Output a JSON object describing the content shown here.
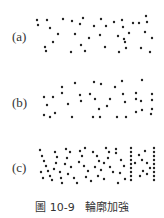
{
  "figure": {
    "caption_number": "圖 10-9",
    "caption_title": "輪廓加強",
    "dot_color": "#222222"
  },
  "panels": [
    {
      "label": "(a)",
      "label_y": 37,
      "dots": [
        [
          37,
          20
        ],
        [
          38,
          25
        ],
        [
          47,
          20
        ],
        [
          50,
          28
        ],
        [
          58,
          34
        ],
        [
          53,
          42
        ],
        [
          45,
          47
        ],
        [
          46,
          51
        ],
        [
          63,
          19
        ],
        [
          72,
          21
        ],
        [
          75,
          34
        ],
        [
          80,
          24
        ],
        [
          83,
          18
        ],
        [
          81,
          45
        ],
        [
          85,
          51
        ],
        [
          89,
          38
        ],
        [
          94,
          26
        ],
        [
          100,
          35
        ],
        [
          101,
          19
        ],
        [
          105,
          47
        ],
        [
          106,
          26
        ],
        [
          114,
          22
        ],
        [
          118,
          36
        ],
        [
          122,
          20
        ],
        [
          123,
          27
        ],
        [
          124,
          39
        ],
        [
          129,
          33
        ],
        [
          125,
          42
        ],
        [
          126,
          48
        ],
        [
          119,
          52
        ],
        [
          133,
          23
        ],
        [
          139,
          23
        ],
        [
          146,
          16
        ],
        [
          147,
          22
        ],
        [
          145,
          32
        ],
        [
          141,
          48
        ],
        [
          152,
          38
        ],
        [
          150,
          52
        ],
        [
          71,
          52
        ]
      ]
    },
    {
      "label": "(b)",
      "label_y": 103,
      "dots": [
        [
          44,
          97
        ],
        [
          47,
          105
        ],
        [
          53,
          97
        ],
        [
          44,
          115
        ],
        [
          50,
          117
        ],
        [
          55,
          113
        ],
        [
          62,
          93
        ],
        [
          62,
          87
        ],
        [
          68,
          104
        ],
        [
          72,
          117
        ],
        [
          75,
          83
        ],
        [
          80,
          95
        ],
        [
          81,
          101
        ],
        [
          90,
          94
        ],
        [
          94,
          82
        ],
        [
          95,
          99
        ],
        [
          101,
          84
        ],
        [
          99,
          109
        ],
        [
          93,
          117
        ],
        [
          100,
          117
        ],
        [
          107,
          106
        ],
        [
          110,
          99
        ],
        [
          115,
          87
        ],
        [
          122,
          81
        ],
        [
          123,
          94
        ],
        [
          125,
          102
        ],
        [
          117,
          117
        ],
        [
          126,
          117
        ],
        [
          136,
          93
        ],
        [
          136,
          99
        ],
        [
          141,
          101
        ],
        [
          136,
          112
        ],
        [
          142,
          110
        ],
        [
          142,
          80
        ],
        [
          152,
          94
        ],
        [
          152,
          100
        ],
        [
          152,
          109
        ],
        [
          151,
          114
        ]
      ]
    },
    {
      "label": "(c)",
      "label_y": 168,
      "dots": [
        [
          40,
          150
        ],
        [
          42,
          156
        ],
        [
          44,
          161
        ],
        [
          46,
          166
        ],
        [
          48,
          171
        ],
        [
          50,
          176
        ],
        [
          52,
          180
        ],
        [
          41,
          172
        ],
        [
          43,
          178
        ],
        [
          55,
          152
        ],
        [
          57,
          157
        ],
        [
          56,
          163
        ],
        [
          54,
          169
        ],
        [
          60,
          172
        ],
        [
          61,
          178
        ],
        [
          62,
          183
        ],
        [
          66,
          149
        ],
        [
          70,
          152
        ],
        [
          67,
          158
        ],
        [
          65,
          164
        ],
        [
          71,
          167
        ],
        [
          68,
          174
        ],
        [
          74,
          178
        ],
        [
          77,
          183
        ],
        [
          80,
          151
        ],
        [
          85,
          148
        ],
        [
          82,
          156
        ],
        [
          79,
          162
        ],
        [
          84,
          166
        ],
        [
          88,
          171
        ],
        [
          86,
          177
        ],
        [
          91,
          181
        ],
        [
          93,
          152
        ],
        [
          97,
          156
        ],
        [
          99,
          161
        ],
        [
          95,
          167
        ],
        [
          101,
          170
        ],
        [
          98,
          176
        ],
        [
          104,
          179
        ],
        [
          106,
          148
        ],
        [
          109,
          152
        ],
        [
          108,
          158
        ],
        [
          104,
          163
        ],
        [
          110,
          167
        ],
        [
          113,
          172
        ],
        [
          116,
          149
        ],
        [
          116,
          153
        ],
        [
          131,
          148
        ],
        [
          131,
          152
        ],
        [
          131,
          156
        ],
        [
          131,
          160
        ],
        [
          131,
          164
        ],
        [
          131,
          168
        ],
        [
          131,
          172
        ],
        [
          131,
          176
        ],
        [
          131,
          180
        ],
        [
          135,
          163
        ],
        [
          139,
          155
        ],
        [
          142,
          160
        ],
        [
          145,
          151
        ],
        [
          147,
          163
        ],
        [
          143,
          171
        ],
        [
          140,
          176
        ],
        [
          150,
          168
        ],
        [
          147,
          174
        ],
        [
          154,
          148
        ],
        [
          154,
          152
        ],
        [
          154,
          156
        ],
        [
          154,
          160
        ],
        [
          154,
          164
        ],
        [
          154,
          168
        ],
        [
          154,
          172
        ],
        [
          154,
          176
        ],
        [
          154,
          180
        ],
        [
          121,
          160
        ],
        [
          124,
          166
        ],
        [
          120,
          173
        ],
        [
          125,
          179
        ],
        [
          118,
          183
        ]
      ]
    }
  ]
}
